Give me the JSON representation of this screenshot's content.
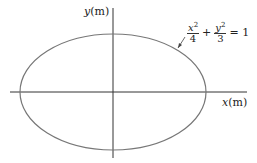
{
  "diagram": {
    "y_axis_label": {
      "var": "y",
      "unit": "(m)"
    },
    "x_axis_label": {
      "var": "x",
      "unit": "(m)"
    },
    "equation": {
      "term1_num": "x",
      "term1_exp": "2",
      "term1_den": "4",
      "plus": "+",
      "term2_num": "y",
      "term2_exp": "2",
      "term2_den": "3",
      "equals": "= 1"
    },
    "ellipse": {
      "a": 2,
      "b_squared": 3,
      "stroke": "#777777"
    },
    "axis_color": "#333333"
  }
}
